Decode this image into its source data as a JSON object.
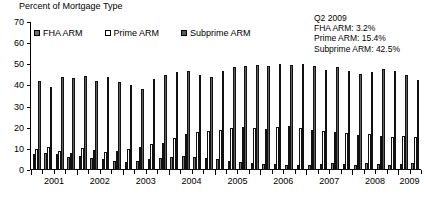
{
  "chart_data": {
    "type": "bar",
    "title": "Percent of Mortgage Type",
    "ylabel": "Percent of Mortgage Type",
    "xlabel": "",
    "ylim": [
      0,
      70
    ],
    "yticks": [
      0,
      10,
      20,
      30,
      40,
      50,
      60,
      70
    ],
    "grid": false,
    "legend_position": "top-left",
    "categories": [
      "2001Q1",
      "2001Q2",
      "2001Q3",
      "2001Q4",
      "2002Q1",
      "2002Q2",
      "2002Q3",
      "2002Q4",
      "2003Q1",
      "2003Q2",
      "2003Q3",
      "2003Q4",
      "2004Q1",
      "2004Q2",
      "2004Q3",
      "2004Q4",
      "2005Q1",
      "2005Q2",
      "2005Q3",
      "2005Q4",
      "2006Q1",
      "2006Q2",
      "2006Q3",
      "2006Q4",
      "2007Q1",
      "2007Q2",
      "2007Q3",
      "2007Q4",
      "2008Q1",
      "2008Q2",
      "2008Q3",
      "2008Q4",
      "2009Q1",
      "2009Q2"
    ],
    "year_labels": [
      "2001",
      "2002",
      "2003",
      "2004",
      "2005",
      "2006",
      "2007",
      "2008",
      "2009"
    ],
    "series": [
      {
        "name": "FHA ARM",
        "color": "#7a7a7a",
        "values": [
          7.5,
          8.0,
          7.5,
          6.0,
          6.5,
          5.5,
          5.0,
          4.5,
          4.0,
          4.5,
          5.0,
          5.5,
          6.0,
          6.5,
          6.0,
          5.5,
          5.0,
          4.5,
          4.0,
          3.5,
          3.0,
          3.0,
          2.5,
          2.5,
          2.5,
          3.0,
          3.5,
          3.0,
          2.5,
          3.5,
          3.0,
          2.5,
          3.0,
          3.2
        ]
      },
      {
        "name": "Prime ARM",
        "color": "#ffffff",
        "values": [
          10.0,
          11.0,
          9.0,
          8.0,
          10.5,
          9.5,
          8.5,
          9.0,
          10.0,
          11.0,
          12.5,
          13.0,
          15.0,
          17.0,
          18.0,
          18.5,
          19.0,
          20.0,
          20.5,
          20.0,
          19.5,
          20.5,
          21.0,
          20.0,
          19.0,
          18.5,
          18.0,
          17.5,
          16.5,
          17.0,
          16.0,
          15.5,
          16.0,
          15.4
        ]
      },
      {
        "name": "Subprime ARM",
        "color": "#5f5f5f",
        "values": [
          42.0,
          39.5,
          44.0,
          43.5,
          44.5,
          42.0,
          44.0,
          41.5,
          40.0,
          38.5,
          43.0,
          45.0,
          46.5,
          47.0,
          45.0,
          44.0,
          47.0,
          48.5,
          49.0,
          49.5,
          49.0,
          50.0,
          49.5,
          50.0,
          49.0,
          47.5,
          48.5,
          47.0,
          45.5,
          46.5,
          48.0,
          47.0,
          45.0,
          42.5
        ]
      }
    ],
    "annotation": {
      "title": "Q2 2009",
      "lines": [
        "FHA ARM: 3.2%",
        "Prime ARM: 15.4%",
        "Subprime ARM: 42.5%"
      ]
    }
  }
}
